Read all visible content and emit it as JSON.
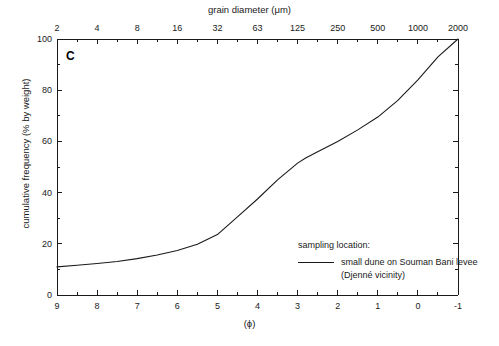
{
  "panel": {
    "label": "C"
  },
  "legend": {
    "heading": "sampling location:",
    "series_label": "small dune on Souman Bani levee",
    "sub_label": "(Djenné vicinity)"
  },
  "chart_data": {
    "type": "line",
    "title": "",
    "panel_label": "C",
    "xlabel": "(ϕ)",
    "ylabel": "cumulative frequency (% by weight)",
    "top_axis_label": "grain diameter (μm)",
    "xlim": [
      9,
      -1
    ],
    "ylim": [
      0,
      100
    ],
    "x_ticks": [
      9,
      8,
      7,
      6,
      5,
      4,
      3,
      2,
      1,
      0,
      -1
    ],
    "x_tick_labels": [
      "9",
      "8",
      "7",
      "6",
      "5",
      "4",
      "3",
      "2",
      "1",
      "0",
      "-1"
    ],
    "top_tick_labels": [
      "2",
      "4",
      "8",
      "16",
      "32",
      "63",
      "125",
      "250",
      "500",
      "1000",
      "2000"
    ],
    "y_ticks": [
      0,
      20,
      40,
      60,
      80,
      100
    ],
    "y_tick_labels": [
      "0",
      "20",
      "40",
      "60",
      "80",
      "100"
    ],
    "y_minor_step": 10,
    "grid": false,
    "legend_position": "inside-lower-right",
    "line_color": "#1a1a1a",
    "series": [
      {
        "name": "small dune on Souman Bani levee (Djenné vicinity)",
        "x": [
          9,
          8.5,
          8,
          7.5,
          7,
          6.5,
          6,
          5.5,
          5,
          4.5,
          4,
          3.5,
          3,
          2.8,
          2.5,
          2,
          1.5,
          1,
          0.5,
          0,
          -0.5,
          -1
        ],
        "values": [
          11,
          11.6,
          12.3,
          13.1,
          14.2,
          15.6,
          17.4,
          19.8,
          23.6,
          30.5,
          37.5,
          45,
          51.5,
          53.5,
          56,
          60,
          64.5,
          69.5,
          76,
          84,
          93,
          100
        ]
      }
    ]
  }
}
